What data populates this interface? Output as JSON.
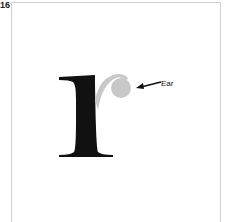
{
  "figure": {
    "number": "16",
    "glyph": "r",
    "annotation": {
      "label": "Ear",
      "highlight_color": "#c8c8c8",
      "glyph_color": "#111111"
    }
  }
}
